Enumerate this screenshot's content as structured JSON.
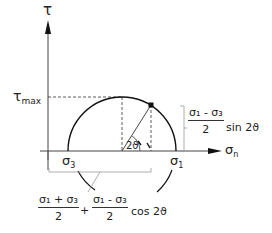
{
  "diagram": {
    "axes": {
      "vertical": {
        "label": "τ"
      },
      "horizontal": {
        "label": "σ",
        "subscript": "n"
      }
    },
    "tick_labels": {
      "tau_max": {
        "symbol": "τ",
        "subscript": "max"
      },
      "sigma3": {
        "symbol": "σ",
        "subscript": "3"
      },
      "sigma1": {
        "symbol": "σ",
        "subscript": "1"
      }
    },
    "angle_label": "2ϑ",
    "annotations": {
      "vertical_dimension": {
        "numerator": "σ₁ - σ₃",
        "denominator": "2",
        "suffix": "sin 2ϑ"
      },
      "horizontal_dimension": {
        "term1_numerator": "σ₁ + σ₃",
        "term1_denominator": "2",
        "operator": "+",
        "term2_numerator": "σ₁ - σ₃",
        "term2_denominator": "2",
        "suffix": "cos 2ϑ"
      }
    },
    "colors": {
      "line": "#1a1a1a",
      "dashed": "#333333",
      "dimension": "#9a9a9a"
    }
  }
}
